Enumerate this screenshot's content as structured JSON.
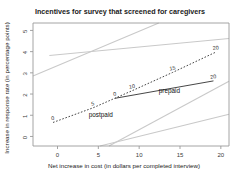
{
  "chart_data": {
    "type": "line",
    "title": "Incentives for survey that screened for caregivers",
    "xlabel": "Net increase in cost (in dollars per completed interview)",
    "ylabel": "Increase in response rate (in percentage points)",
    "xlim": [
      -3,
      21
    ],
    "ylim": [
      -0.45,
      5.35
    ],
    "xticks": [
      0,
      5,
      10,
      15,
      20
    ],
    "yticks": [
      0,
      1,
      2,
      3,
      4,
      5
    ],
    "grid": false,
    "legend": "inline-labels",
    "series": [
      {
        "name": "postpaid",
        "style": "dashed",
        "color": "#3c3c3c",
        "label": "postpaid",
        "label_x": 5.3,
        "label_y": 0.92,
        "points": [
          {
            "label": "0",
            "x": -0.55,
            "y": 0.66
          },
          {
            "label": "5",
            "x": 4.35,
            "y": 1.35
          },
          {
            "label": "10",
            "x": 9.15,
            "y": 2.16
          },
          {
            "label": "15",
            "x": 14.1,
            "y": 3.02
          },
          {
            "label": "20",
            "x": 19.4,
            "y": 3.98
          }
        ]
      },
      {
        "name": "prepaid",
        "style": "solid",
        "color": "#3c3c3c",
        "label": "prepaid",
        "label_x": 13.7,
        "label_y": 2.05,
        "points": [
          {
            "label": "0",
            "x": 7.05,
            "y": 1.8
          },
          {
            "label": "20",
            "x": 19.1,
            "y": 2.62
          }
        ]
      }
    ],
    "reference_rays": [
      {
        "name": "ray-upper-left",
        "x0": -3.0,
        "y0": 2.85,
        "x1": 12.4,
        "y1": 5.35
      },
      {
        "name": "ray-upper-right",
        "x0": -1.0,
        "y0": 3.82,
        "x1": 21.0,
        "y1": 4.62
      },
      {
        "name": "ray-lower-steep",
        "x0": 6.3,
        "y0": -0.45,
        "x1": 21.0,
        "y1": 2.6
      },
      {
        "name": "ray-lower-flat",
        "x0": 5.2,
        "y0": -0.45,
        "x1": 21.0,
        "y1": 1.05
      }
    ],
    "colors": {
      "reference_ray": "#c9c9c9",
      "series_line": "#3c3c3c",
      "frame": "#9a9a9a",
      "text": "#1a1a1a"
    }
  }
}
